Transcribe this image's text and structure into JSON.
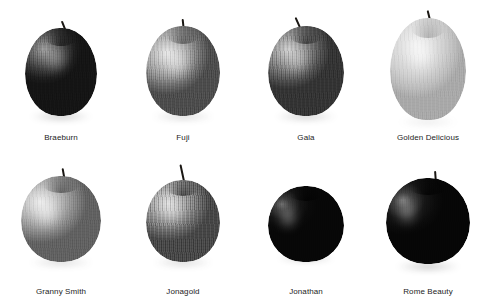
{
  "figure": {
    "columns": 4,
    "rows": 2,
    "background_color": "#ffffff",
    "label_color": "#1c1c1c",
    "rendering": "grayscale photographic plate"
  },
  "items": [
    {
      "label": "Braeburn",
      "row": 1,
      "column": 1,
      "icon": "apple-icon",
      "tone": "dark",
      "body_width": 72,
      "body_height": 88,
      "body_top": 28,
      "stem_height": 14,
      "stem_width": 2,
      "stem_left": 6,
      "stem_rotate": -22,
      "skin_css": "radial-gradient(ellipse 52% 40% at 26% 24%, #9a9a9a 0%, #6f6f6f 26%, #3c3c3c 58%, #1e1e1e 82%, #141414 100%)",
      "sheen": {
        "w": 26,
        "h": 30,
        "x": 18,
        "y": 16,
        "color": "rgba(235,235,235,0.40)"
      },
      "dimple_css": "radial-gradient(ellipse at 50% 100%, rgba(0,0,0,0.55) 0%, rgba(0,0,0,0) 70%)",
      "striping": 0.34,
      "speckle": 0.42,
      "shadow": {
        "w": 62,
        "h": 9,
        "top": 112,
        "color": "rgba(40,40,40,0.55)"
      }
    },
    {
      "label": "Fuji",
      "row": 1,
      "column": 2,
      "icon": "apple-icon",
      "tone": "medium",
      "body_width": 74,
      "body_height": 90,
      "body_top": 26,
      "stem_height": 13,
      "stem_width": 2,
      "stem_left": 1,
      "stem_rotate": -6,
      "skin_css": "radial-gradient(ellipse 58% 46% at 28% 30%, #e6e6e6 0%, #c6c6c6 24%, #9d9d9d 52%, #6e6e6e 78%, #4c4c4c 100%)",
      "sheen": {
        "w": 30,
        "h": 36,
        "x": 16,
        "y": 18,
        "color": "rgba(255,255,255,0.55)"
      },
      "dimple_css": "radial-gradient(ellipse at 50% 100%, rgba(0,0,0,0.40) 0%, rgba(0,0,0,0) 72%)",
      "striping": 0.3,
      "speckle": 0.5,
      "shadow": {
        "w": 62,
        "h": 9,
        "top": 112,
        "color": "rgba(60,60,60,0.45)"
      }
    },
    {
      "label": "Gala",
      "row": 1,
      "column": 3,
      "icon": "apple-icon",
      "tone": "medium-dark",
      "body_width": 76,
      "body_height": 90,
      "body_top": 26,
      "stem_height": 16,
      "stem_width": 2,
      "stem_left": -4,
      "stem_rotate": -24,
      "skin_css": "radial-gradient(ellipse 56% 44% at 26% 26%, #cfcfcf 0%, #a8a8a8 24%, #7b7b7b 52%, #515151 78%, #343434 100%)",
      "sheen": {
        "w": 26,
        "h": 32,
        "x": 16,
        "y": 18,
        "color": "rgba(248,248,248,0.45)"
      },
      "dimple_css": "radial-gradient(ellipse at 50% 100%, rgba(0,0,0,0.50) 0%, rgba(0,0,0,0) 70%)",
      "striping": 0.46,
      "speckle": 0.46,
      "shadow": {
        "w": 62,
        "h": 9,
        "top": 112,
        "color": "rgba(45,45,45,0.50)"
      }
    },
    {
      "label": "Golden Delicious",
      "row": 1,
      "column": 4,
      "icon": "apple-icon",
      "tone": "light",
      "body_width": 76,
      "body_height": 102,
      "body_top": 18,
      "stem_height": 14,
      "stem_width": 2,
      "stem_left": 3,
      "stem_rotate": -14,
      "skin_css": "radial-gradient(ellipse 62% 52% at 34% 26%, #f2f2f2 0%, #e3e3e3 30%, #d2d2d2 58%, #bdbdbd 82%, #a9a9a9 100%)",
      "sheen": {
        "w": 30,
        "h": 40,
        "x": 16,
        "y": 16,
        "color": "rgba(255,255,255,0.70)"
      },
      "dimple_css": "radial-gradient(ellipse at 50% 100%, rgba(0,0,0,0.22) 0%, rgba(0,0,0,0) 72%)",
      "striping": 0.1,
      "speckle": 0.22,
      "shadow": {
        "w": 60,
        "h": 8,
        "top": 118,
        "color": "rgba(120,120,120,0.35)"
      }
    },
    {
      "label": "Granny Smith",
      "row": 2,
      "column": 1,
      "icon": "apple-icon",
      "tone": "light-medium",
      "body_width": 80,
      "body_height": 86,
      "body_top": 22,
      "stem_height": 14,
      "stem_width": 2,
      "stem_left": 4,
      "stem_rotate": -10,
      "skin_css": "radial-gradient(ellipse 58% 48% at 24% 30%, #ececec 0%, #cfcfcf 26%, #a6a6a6 54%, #7e7e7e 80%, #606060 100%)",
      "sheen": {
        "w": 28,
        "h": 34,
        "x": 12,
        "y": 20,
        "color": "rgba(255,255,255,0.60)"
      },
      "dimple_css": "radial-gradient(ellipse at 50% 100%, rgba(0,0,0,0.42) 0%, rgba(0,0,0,0) 72%)",
      "striping": 0.14,
      "speckle": 0.3,
      "shadow": {
        "w": 64,
        "h": 9,
        "top": 104,
        "color": "rgba(70,70,70,0.45)"
      }
    },
    {
      "label": "Jonagold",
      "row": 2,
      "column": 2,
      "icon": "apple-icon",
      "tone": "mottled",
      "body_width": 74,
      "body_height": 82,
      "body_top": 26,
      "stem_height": 22,
      "stem_width": 2,
      "stem_left": 2,
      "stem_rotate": -12,
      "skin_css": "radial-gradient(ellipse 56% 46% at 30% 28%, #dedede 0%, #bcbcbc 24%, #8e8e8e 52%, #636363 80%, #474747 100%)",
      "sheen": {
        "w": 24,
        "h": 28,
        "x": 14,
        "y": 18,
        "color": "rgba(250,250,250,0.45)"
      },
      "dimple_css": "radial-gradient(ellipse at 50% 100%, rgba(0,0,0,0.55) 0%, rgba(0,0,0,0) 68%)",
      "striping": 0.5,
      "speckle": 0.7,
      "shadow": {
        "w": 60,
        "h": 9,
        "top": 104,
        "color": "rgba(60,60,60,0.45)"
      }
    },
    {
      "label": "Jonathan",
      "row": 2,
      "column": 3,
      "icon": "apple-icon",
      "tone": "very-dark",
      "body_width": 76,
      "body_height": 76,
      "body_top": 32,
      "stem_height": 0,
      "stem_width": 2,
      "stem_left": 0,
      "stem_rotate": 0,
      "skin_css": "radial-gradient(ellipse 46% 38% at 18% 24%, #6a6a6a 0%, #3a3a3a 22%, #151515 52%, #0a0a0a 78%, #070707 100%)",
      "sheen": {
        "w": 20,
        "h": 26,
        "x": 10,
        "y": 18,
        "color": "rgba(210,210,210,0.55)"
      },
      "dimple_css": "radial-gradient(ellipse at 50% 100%, rgba(0,0,0,0.70) 0%, rgba(0,0,0,0) 66%)",
      "striping": 0.16,
      "speckle": 0.18,
      "shadow": {
        "w": 58,
        "h": 8,
        "top": 100,
        "color": "rgba(30,30,30,0.55)"
      }
    },
    {
      "label": "Rome Beauty",
      "row": 2,
      "column": 4,
      "icon": "apple-icon",
      "tone": "very-dark",
      "body_width": 84,
      "body_height": 86,
      "body_top": 24,
      "stem_height": 13,
      "stem_width": 2,
      "stem_left": 8,
      "stem_rotate": -4,
      "skin_css": "radial-gradient(ellipse 48% 40% at 20% 26%, #757575 0%, #404040 22%, #161616 54%, #0b0b0b 80%, #060606 100%)",
      "sheen": {
        "w": 22,
        "h": 30,
        "x": 10,
        "y": 18,
        "color": "rgba(215,215,215,0.52)"
      },
      "dimple_css": "radial-gradient(ellipse at 50% 100%, rgba(0,0,0,0.70) 0%, rgba(0,0,0,0) 66%)",
      "striping": 0.16,
      "speckle": 0.18,
      "shadow": {
        "w": 64,
        "h": 9,
        "top": 108,
        "color": "rgba(30,30,30,0.55)"
      }
    }
  ]
}
